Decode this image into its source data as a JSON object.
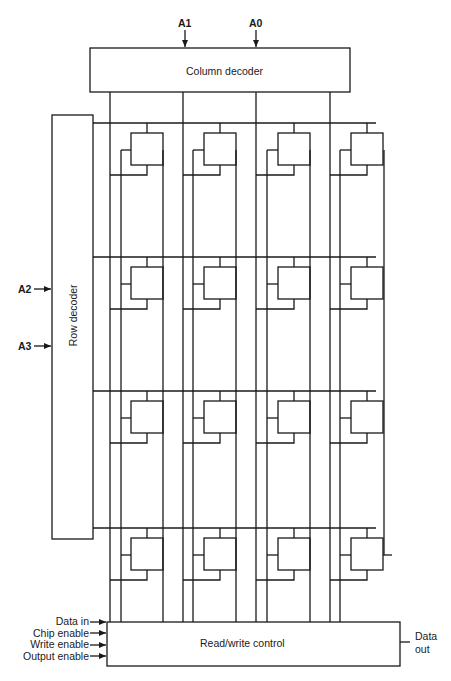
{
  "diagram": {
    "title": "",
    "type": "memory-array-block-diagram",
    "column_decoder": {
      "label": "Column decoder",
      "inputs": [
        "A1",
        "A0"
      ]
    },
    "row_decoder": {
      "label": "Row decoder",
      "inputs": [
        "A2",
        "A3"
      ]
    },
    "rw_control": {
      "label": "Read/write control",
      "inputs": [
        "Data in",
        "Chip enable",
        "Write enable",
        "Output enable"
      ],
      "output_line1": "Data",
      "output_line2": "out"
    },
    "array": {
      "rows": 4,
      "columns": 4,
      "cells": 16
    },
    "colors": {
      "line": "#1a1a1a",
      "background": "#ffffff"
    }
  }
}
